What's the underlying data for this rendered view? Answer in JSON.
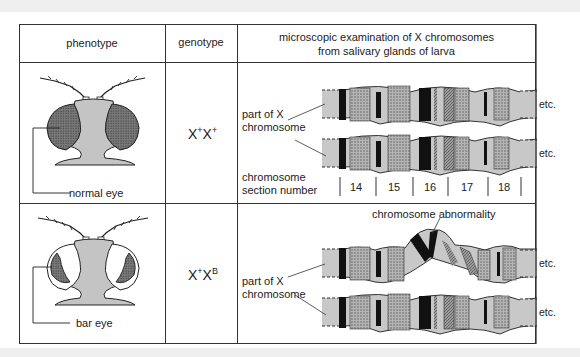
{
  "table": {
    "headers": {
      "phenotype": "phenotype",
      "genotype": "genotype",
      "examination_line1": "microscopic examination of X chromosomes",
      "examination_line2": "from salivary glands of larva"
    },
    "rows": [
      {
        "phenotype_label": "normal eye",
        "genotype_base1": "X",
        "genotype_sup1": "+",
        "genotype_base2": "X",
        "genotype_sup2": "+",
        "chromosome_label_line1": "part of X",
        "chromosome_label_line2": "chromosome",
        "etc_label": "etc.",
        "section_label_line1": "chromosome",
        "section_label_line2": "section number",
        "section_numbers": [
          "14",
          "15",
          "16",
          "17",
          "18"
        ]
      },
      {
        "phenotype_label": "bar eye",
        "genotype_base1": "X",
        "genotype_sup1": "+",
        "genotype_base2": "X",
        "genotype_sup2": "B",
        "chromosome_label_line1": "part of X",
        "chromosome_label_line2": "chromosome",
        "etc_label": "etc.",
        "abnormality_label": "chromosome abnormality"
      }
    ]
  },
  "colors": {
    "line": "#333333",
    "chromosome_light": "#c8c8c8",
    "chromosome_dotted": "#a8a8a8",
    "band_dark": "#111111",
    "eye_fill": "#8a8a8a",
    "head_fill": "#c4c4c4",
    "page_band": "#efefef"
  }
}
